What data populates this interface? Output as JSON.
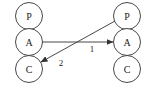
{
  "diagram": {
    "left_stack": {
      "nodes": [
        {
          "label": "P",
          "cx": 29,
          "cy": 16
        },
        {
          "label": "A",
          "cx": 29,
          "cy": 42
        },
        {
          "label": "C",
          "cx": 29,
          "cy": 69
        }
      ]
    },
    "right_stack": {
      "nodes": [
        {
          "label": "P",
          "cx": 127,
          "cy": 16
        },
        {
          "label": "A",
          "cx": 127,
          "cy": 42
        },
        {
          "label": "C",
          "cx": 127,
          "cy": 69
        }
      ]
    },
    "node_radius": 14,
    "edges": [
      {
        "label": "1",
        "from": "left.A",
        "to": "right.A"
      },
      {
        "label": "2",
        "from": "right.P",
        "to": "left.C"
      }
    ],
    "colors": {
      "stroke": "#333333",
      "text": "#222222",
      "background": "#ffffff"
    }
  }
}
